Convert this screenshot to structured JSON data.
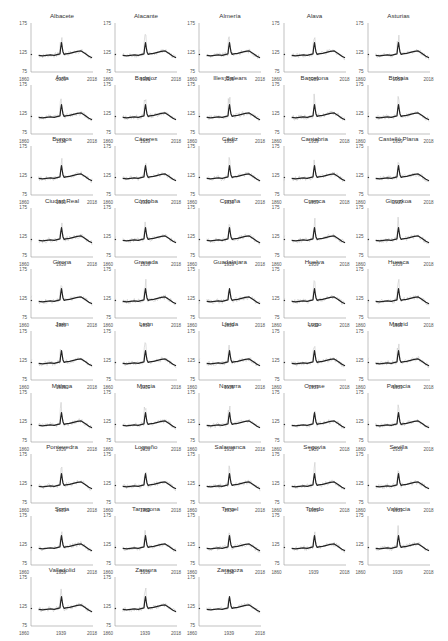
{
  "chart_data": {
    "type": "line",
    "layout": "small-multiples grid, 5 columns x 10 rows, 48 panels",
    "x_range": [
      1860,
      2018
    ],
    "x_ticks": [
      "1860",
      "1939",
      "2018"
    ],
    "y_range": [
      75,
      175
    ],
    "y_ticks": [
      "175",
      "125",
      "75"
    ],
    "grid": false,
    "legend": null,
    "series_description": "Each panel: black line = national reference series; light grey line = province series",
    "reference_series": {
      "name": "Spain (reference)",
      "color": "#222222",
      "segments": [
        {
          "x": [
            1860,
            1861,
            1862
          ],
          "y": [
            110,
            111,
            110
          ]
        },
        {
          "x": [
            1880,
            1890,
            1900,
            1910,
            1920,
            1930,
            1935,
            1937,
            1939,
            1941,
            1943,
            1946,
            1950,
            1960,
            1970,
            1980,
            1990,
            2000,
            2010,
            2018
          ],
          "y": [
            109,
            108,
            109,
            110,
            109,
            111,
            112,
            125,
            135,
            124,
            116,
            111,
            112,
            113,
            115,
            117,
            118,
            113,
            107,
            104
          ]
        }
      ]
    },
    "panels": [
      {
        "title": "Albacete"
      },
      {
        "title": "Alacante"
      },
      {
        "title": "Almería"
      },
      {
        "title": "Alava"
      },
      {
        "title": "Asturias"
      },
      {
        "title": "Ávila"
      },
      {
        "title": "Badajoz"
      },
      {
        "title": "Illes Balears"
      },
      {
        "title": "Barcelona"
      },
      {
        "title": "Bizkaia"
      },
      {
        "title": "Burgos"
      },
      {
        "title": "Cáceres"
      },
      {
        "title": "Cádiz"
      },
      {
        "title": "Cantabria"
      },
      {
        "title": "Castelló Plana"
      },
      {
        "title": "Ciudad Real"
      },
      {
        "title": "Córdoba"
      },
      {
        "title": "Coruña"
      },
      {
        "title": "Cuenca"
      },
      {
        "title": "Gipuzkoa"
      },
      {
        "title": "Girona"
      },
      {
        "title": "Granada"
      },
      {
        "title": "Guadalajara"
      },
      {
        "title": "Huelva"
      },
      {
        "title": "Huesca"
      },
      {
        "title": "Jaén"
      },
      {
        "title": "León"
      },
      {
        "title": "Lleida"
      },
      {
        "title": "Lugo"
      },
      {
        "title": "Madrid"
      },
      {
        "title": "Málaga"
      },
      {
        "title": "Murcia"
      },
      {
        "title": "Navarra"
      },
      {
        "title": "Orense"
      },
      {
        "title": "Palencia"
      },
      {
        "title": "Pontevedra"
      },
      {
        "title": "Logroño"
      },
      {
        "title": "Salamanca"
      },
      {
        "title": "Segovia"
      },
      {
        "title": "Sevilla"
      },
      {
        "title": "Soria"
      },
      {
        "title": "Tarragona"
      },
      {
        "title": "Teruel"
      },
      {
        "title": "Toledo"
      },
      {
        "title": "València"
      },
      {
        "title": "Valladolid"
      },
      {
        "title": "Zamora"
      },
      {
        "title": "Zaragoza"
      }
    ],
    "colors": {
      "reference": "#222222",
      "province": "#c8c8c8",
      "axis": "#999999",
      "text": "#333333"
    }
  }
}
